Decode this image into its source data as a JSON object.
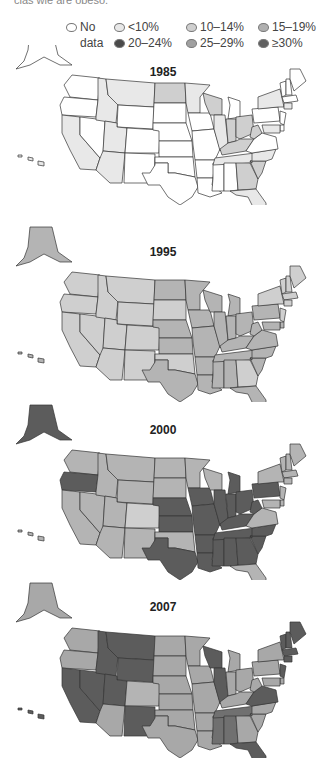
{
  "header": {
    "cut_text": "clas wle are obeso."
  },
  "legend": {
    "items": [
      {
        "label": "No",
        "label2": "data",
        "color": "#ffffff"
      },
      {
        "label": "<10%",
        "color": "#e8e8e8"
      },
      {
        "label": "10–14%",
        "color": "#cfcfcf"
      },
      {
        "label": "15–19%",
        "color": "#b0b0b0"
      },
      {
        "label": "20–24%",
        "color": "#5a5a5a"
      },
      {
        "label": "25–29%",
        "color": "#a6a6a6"
      },
      {
        "label": "≥30%",
        "color": "#6a6a6a"
      }
    ]
  },
  "maps": [
    {
      "year": "1985"
    },
    {
      "year": "1995"
    },
    {
      "year": "2000"
    },
    {
      "year": "2007"
    }
  ],
  "chart_data": {
    "type": "choropleth",
    "legend": [
      "No data",
      "<10%",
      "10–14%",
      "15–19%",
      "20–24%",
      "25–29%",
      "≥30%"
    ],
    "panels": [
      {
        "year": "1985",
        "states": {
          "WA": "none",
          "OR": "none",
          "CA": "lt10",
          "NV": "none",
          "ID": "lt10",
          "MT": "lt10",
          "WY": "none",
          "UT": "lt10",
          "AZ": "lt10",
          "CO": "none",
          "NM": "none",
          "ND": "10-14",
          "SD": "none",
          "NE": "none",
          "KS": "none",
          "OK": "none",
          "TX": "none",
          "MN": "lt10",
          "IA": "none",
          "MO": "none",
          "AR": "none",
          "LA": "none",
          "WI": "10-14",
          "IL": "lt10",
          "MS": "none",
          "MI": "none",
          "IN": "10-14",
          "OH": "10-14",
          "KY": "10-14",
          "TN": "lt10",
          "AL": "none",
          "GA": "10-14",
          "FL": "lt10",
          "SC": "10-14",
          "NC": "lt10",
          "VA": "none",
          "WV": "10-14",
          "PA": "none",
          "NY": "lt10",
          "VT": "none",
          "NH": "none",
          "ME": "none",
          "MA": "none",
          "CT": "lt10",
          "NJ": "none",
          "DE": "none",
          "MD": "lt10",
          "AK": "none",
          "HI": "lt10"
        }
      },
      {
        "year": "1995",
        "states": {
          "WA": "10-14",
          "OR": "10-14",
          "CA": "10-14",
          "NV": "10-14",
          "ID": "10-14",
          "MT": "10-14",
          "WY": "10-14",
          "UT": "10-14",
          "AZ": "10-14",
          "CO": "10-14",
          "NM": "10-14",
          "ND": "15-19",
          "SD": "10-14",
          "NE": "15-19",
          "KS": "15-19",
          "OK": "10-14",
          "TX": "15-19",
          "MN": "15-19",
          "IA": "15-19",
          "MO": "15-19",
          "AR": "15-19",
          "LA": "15-19",
          "WI": "15-19",
          "IL": "15-19",
          "MS": "15-19",
          "MI": "15-19",
          "IN": "15-19",
          "OH": "15-19",
          "KY": "15-19",
          "TN": "15-19",
          "AL": "15-19",
          "GA": "10-14",
          "FL": "15-19",
          "SC": "15-19",
          "NC": "15-19",
          "VA": "15-19",
          "WV": "15-19",
          "PA": "15-19",
          "NY": "10-14",
          "VT": "10-14",
          "NH": "10-14",
          "ME": "10-14",
          "MA": "10-14",
          "CT": "10-14",
          "NJ": "10-14",
          "DE": "15-19",
          "MD": "15-19",
          "AK": "15-19",
          "HI": "15-19"
        }
      },
      {
        "year": "2000",
        "states": {
          "WA": "15-19",
          "OR": "20-24",
          "CA": "15-19",
          "NV": "15-19",
          "ID": "15-19",
          "MT": "15-19",
          "WY": "15-19",
          "UT": "15-19",
          "AZ": "15-19",
          "CO": "10-14",
          "NM": "15-19",
          "ND": "15-19",
          "SD": "15-19",
          "NE": "20-24",
          "KS": "20-24",
          "OK": "15-19",
          "TX": "20-24",
          "MN": "15-19",
          "IA": "20-24",
          "MO": "20-24",
          "AR": "20-24",
          "LA": "20-24",
          "WI": "15-19",
          "IL": "20-24",
          "MS": "20-24",
          "MI": "20-24",
          "IN": "20-24",
          "OH": "20-24",
          "KY": "20-24",
          "TN": "20-24",
          "AL": "20-24",
          "GA": "20-24",
          "FL": "15-19",
          "SC": "20-24",
          "NC": "20-24",
          "VA": "15-19",
          "WV": "20-24",
          "PA": "20-24",
          "NY": "15-19",
          "VT": "15-19",
          "NH": "15-19",
          "ME": "15-19",
          "MA": "15-19",
          "CT": "15-19",
          "NJ": "15-19",
          "DE": "15-19",
          "MD": "15-19",
          "AK": "20-24",
          "HI": "15-19"
        }
      },
      {
        "year": "2007",
        "states": {
          "WA": "25-29",
          "OR": "25-29",
          "CA": "20-24",
          "NV": "20-24",
          "ID": "20-24",
          "MT": "20-24",
          "WY": "20-24",
          "UT": "20-24",
          "AZ": "25-29",
          "CO": "15-19",
          "NM": "20-24",
          "ND": "25-29",
          "SD": "25-29",
          "NE": "25-29",
          "KS": "25-29",
          "OK": "25-29",
          "TX": "25-29",
          "MN": "25-29",
          "IA": "25-29",
          "MO": "25-29",
          "AR": "25-29",
          "LA": "25-29",
          "WI": "20-24",
          "IL": "20-24",
          "MS": "ge30",
          "MI": "25-29",
          "IN": "25-29",
          "OH": "25-29",
          "KY": "25-29",
          "TN": "ge30",
          "AL": "ge30",
          "GA": "25-29",
          "FL": "20-24",
          "SC": "25-29",
          "NC": "25-29",
          "VA": "20-24",
          "WV": "25-29",
          "PA": "25-29",
          "NY": "25-29",
          "VT": "20-24",
          "NH": "20-24",
          "ME": "20-24",
          "MA": "20-24",
          "CT": "20-24",
          "NJ": "20-24",
          "DE": "25-29",
          "MD": "25-29",
          "AK": "25-29",
          "HI": "20-24"
        }
      }
    ]
  }
}
